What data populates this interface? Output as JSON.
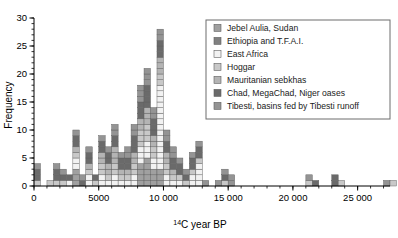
{
  "chart_data": {
    "type": "bar",
    "subtype": "stacked-histogram",
    "title": "",
    "xlabel": "14C year BP",
    "xlabel_parts": {
      "sup": "14",
      "rest": "C year BP"
    },
    "ylabel": "Frequency",
    "xlim": [
      0,
      27500
    ],
    "ylim": [
      0,
      30
    ],
    "x_ticks": [
      0,
      5000,
      10000,
      15000,
      20000,
      25000
    ],
    "x_tick_labels": [
      "0",
      "5000",
      "10 000",
      "15 000",
      "20 000",
      "25 000"
    ],
    "x_minor_tick_step": 1000,
    "y_ticks": [
      0,
      5,
      10,
      15,
      20,
      25,
      30
    ],
    "y_tick_labels": [
      "0",
      "5",
      "10",
      "15",
      "20",
      "25",
      "30"
    ],
    "y_minor_tick_step": 1,
    "bin_width": 500,
    "grid": false,
    "legend_position": "top-right",
    "series": [
      {
        "name": "Jebel Aulia, Sudan",
        "color": "#a0a0a0",
        "key": "jebel"
      },
      {
        "name": "Ethiopia and T.F.A.I.",
        "color": "#808080",
        "key": "ethiopia"
      },
      {
        "name": "East Africa",
        "color": "#f2f2f2",
        "key": "eastafrica"
      },
      {
        "name": "Hoggar",
        "color": "#c8c8c8",
        "key": "hoggar"
      },
      {
        "name": "Mauritanian sebkhas",
        "color": "#b4b4b4",
        "key": "mauritanian"
      },
      {
        "name": "Chad, MegaChad, Niger oases",
        "color": "#6a6a6a",
        "key": "chad"
      },
      {
        "name": "Tibesti, basins fed by Tibesti runoff",
        "color": "#949494",
        "key": "tibesti"
      }
    ],
    "bins": [
      {
        "x0": 0,
        "counts": {
          "chad": 2,
          "hoggar": 1,
          "tibesti": 1
        }
      },
      {
        "x0": 500,
        "counts": {}
      },
      {
        "x0": 1000,
        "counts": {
          "hoggar": 1
        }
      },
      {
        "x0": 1500,
        "counts": {
          "chad": 2,
          "hoggar": 1,
          "tibesti": 1
        }
      },
      {
        "x0": 2000,
        "counts": {
          "chad": 1,
          "tibesti": 1,
          "hoggar": 1
        }
      },
      {
        "x0": 2500,
        "counts": {
          "chad": 1,
          "eastafrica": 1
        }
      },
      {
        "x0": 3000,
        "counts": {
          "chad": 2,
          "tibesti": 1,
          "hoggar": 1,
          "mauritanian": 1,
          "eastafrica": 2,
          "jebel": 3
        }
      },
      {
        "x0": 3500,
        "counts": {
          "chad": 1,
          "tibesti": 1
        }
      },
      {
        "x0": 4000,
        "counts": {
          "chad": 2,
          "tibesti": 1,
          "hoggar": 1,
          "eastafrica": 2,
          "mauritanian": 1
        }
      },
      {
        "x0": 4500,
        "counts": {
          "chad": 1,
          "hoggar": 1
        }
      },
      {
        "x0": 5000,
        "counts": {
          "chad": 2,
          "tibesti": 1,
          "hoggar": 2,
          "eastafrica": 2,
          "mauritanian": 2
        }
      },
      {
        "x0": 5500,
        "counts": {
          "chad": 2,
          "tibesti": 1,
          "eastafrica": 1,
          "hoggar": 1,
          "mauritanian": 2
        }
      },
      {
        "x0": 6000,
        "counts": {
          "chad": 2,
          "tibesti": 2,
          "hoggar": 2,
          "eastafrica": 2,
          "mauritanian": 3
        }
      },
      {
        "x0": 6500,
        "counts": {
          "chad": 2,
          "tibesti": 1,
          "hoggar": 1,
          "eastafrica": 1,
          "mauritanian": 1
        }
      },
      {
        "x0": 7000,
        "counts": {
          "chad": 2,
          "tibesti": 2,
          "hoggar": 1,
          "eastafrica": 1,
          "mauritanian": 1
        }
      },
      {
        "x0": 7500,
        "counts": {
          "chad": 3,
          "tibesti": 2,
          "hoggar": 2,
          "eastafrica": 2,
          "mauritanian": 2
        }
      },
      {
        "x0": 8000,
        "counts": {
          "chad": 3,
          "tibesti": 3,
          "hoggar": 3,
          "eastafrica": 3,
          "mauritanian": 2,
          "jebel": 4
        }
      },
      {
        "x0": 8500,
        "counts": {
          "chad": 4,
          "tibesti": 3,
          "hoggar": 3,
          "eastafrica": 3,
          "mauritanian": 3,
          "jebel": 5
        }
      },
      {
        "x0": 9000,
        "counts": {
          "chad": 3,
          "tibesti": 2,
          "hoggar": 2,
          "eastafrica": 2,
          "mauritanian": 2,
          "jebel": 3
        }
      },
      {
        "x0": 9500,
        "counts": {
          "chad": 3,
          "tibesti": 2,
          "hoggar": 2,
          "eastafrica": 15,
          "mauritanian": 3,
          "jebel": 3
        }
      },
      {
        "x0": 10000,
        "counts": {
          "chad": 2,
          "tibesti": 2,
          "hoggar": 2,
          "eastafrica": 2,
          "mauritanian": 2
        }
      },
      {
        "x0": 10500,
        "counts": {
          "chad": 2,
          "tibesti": 2,
          "hoggar": 1,
          "eastafrica": 1,
          "mauritanian": 1
        }
      },
      {
        "x0": 11000,
        "counts": {
          "chad": 2,
          "tibesti": 1,
          "hoggar": 1,
          "eastafrica": 1
        }
      },
      {
        "x0": 11500,
        "counts": {
          "chad": 1,
          "tibesti": 1,
          "hoggar": 1
        }
      },
      {
        "x0": 12000,
        "counts": {
          "chad": 2,
          "tibesti": 1,
          "eastafrica": 2,
          "hoggar": 1
        }
      },
      {
        "x0": 12500,
        "counts": {
          "chad": 2,
          "tibesti": 1,
          "eastafrica": 4,
          "hoggar": 1
        }
      },
      {
        "x0": 13000,
        "counts": {
          "tibesti": 1
        }
      },
      {
        "x0": 13500,
        "counts": {}
      },
      {
        "x0": 14000,
        "counts": {
          "tibesti": 1
        }
      },
      {
        "x0": 14500,
        "counts": {
          "chad": 1,
          "tibesti": 1,
          "hoggar": 1
        }
      },
      {
        "x0": 15000,
        "counts": {
          "tibesti": 2
        }
      },
      {
        "x0": 21000,
        "counts": {
          "hoggar": 1,
          "tibesti": 1
        }
      },
      {
        "x0": 21500,
        "counts": {
          "chad": 1
        }
      },
      {
        "x0": 23000,
        "counts": {
          "chad": 2
        }
      },
      {
        "x0": 23500,
        "counts": {
          "hoggar": 1
        }
      },
      {
        "x0": 27000,
        "counts": {
          "tibesti": 1
        }
      },
      {
        "x0": 27500,
        "counts": {
          "hoggar": 1
        }
      }
    ]
  }
}
